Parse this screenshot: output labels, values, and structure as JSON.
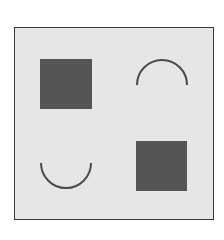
{
  "diagram": {
    "type": "shape-grid",
    "frame": {
      "border_color": "#3a3a3a",
      "background": "#e6e6e6"
    },
    "colors": {
      "fill": "#555555",
      "stroke": "#4a4a4a"
    },
    "cells": [
      {
        "position": "top-left",
        "shape": "filled-square"
      },
      {
        "position": "top-right",
        "shape": "arc-opening-down"
      },
      {
        "position": "bottom-left",
        "shape": "arc-opening-up"
      },
      {
        "position": "bottom-right",
        "shape": "filled-square"
      }
    ]
  }
}
